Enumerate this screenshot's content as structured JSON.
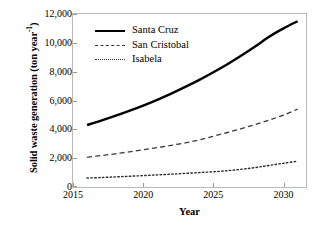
{
  "chart_data": {
    "type": "line",
    "title": "",
    "xlabel": "Year",
    "ylabel": "Solid waste generation (ton year",
    "ylabel_sup": "-1",
    "ylabel_close": ")",
    "xlim": [
      2015,
      2031.6
    ],
    "ylim": [
      0,
      12000
    ],
    "grid": false,
    "legend_position": "upper-left-inside",
    "xticks": [
      "2015",
      "2020",
      "2025",
      "2030"
    ],
    "xtick_values": [
      2015,
      2020,
      2025,
      2030
    ],
    "yticks": [
      "0",
      "2,000",
      "4,000",
      "6,000",
      "8,000",
      "10,000",
      "12,000"
    ],
    "ytick_values": [
      0,
      2000,
      4000,
      6000,
      8000,
      10000,
      12000
    ],
    "x": [
      2016,
      2017,
      2018,
      2019,
      2020,
      2021,
      2022,
      2023,
      2024,
      2025,
      2026,
      2027,
      2028,
      2029,
      2030,
      2031
    ],
    "series": [
      {
        "name": "Santa Cruz",
        "style": "solid",
        "color": "#000000",
        "width": 2.4,
        "values": [
          4300,
          4600,
          4930,
          5280,
          5650,
          6050,
          6480,
          6940,
          7430,
          7960,
          8520,
          9120,
          9760,
          10440,
          11000,
          11500
        ]
      },
      {
        "name": "San Cristobal",
        "style": "dashed",
        "color": "#3a3a3a",
        "width": 1.3,
        "values": [
          2060,
          2180,
          2300,
          2440,
          2580,
          2730,
          2890,
          3060,
          3270,
          3520,
          3780,
          4050,
          4340,
          4650,
          4990,
          5400
        ]
      },
      {
        "name": "Isabela",
        "style": "dotted",
        "color": "#2b2b2b",
        "width": 1.4,
        "values": [
          620,
          660,
          700,
          745,
          790,
          840,
          890,
          945,
          1000,
          1060,
          1130,
          1230,
          1350,
          1500,
          1650,
          1790
        ]
      }
    ]
  },
  "legend": {
    "items": [
      {
        "label": "Santa Cruz"
      },
      {
        "label": "San Cristobal"
      },
      {
        "label": "Isabela"
      }
    ]
  }
}
